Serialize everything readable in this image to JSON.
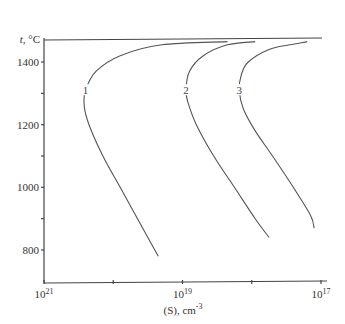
{
  "chart_data": {
    "type": "line",
    "title": "",
    "ylabel": "t, °C",
    "xlabel": "(S), cm",
    "xlabel_exponent": "-3",
    "x_scale": "log (reversed)",
    "xlim": [
      "1e21",
      "1e17"
    ],
    "ylim": [
      700,
      1480
    ],
    "y_ticks": [
      {
        "value": 1400,
        "label": "1400"
      },
      {
        "value": 1300,
        "label": ""
      },
      {
        "value": 1200,
        "label": "1200"
      },
      {
        "value": 1100,
        "label": ""
      },
      {
        "value": 1000,
        "label": "1000"
      },
      {
        "value": 900,
        "label": ""
      },
      {
        "value": 800,
        "label": "800"
      }
    ],
    "x_ticks": [
      {
        "value": "1e21",
        "base": "10",
        "exp": "21"
      },
      {
        "value": "1e20",
        "base": "",
        "exp": ""
      },
      {
        "value": "1e19",
        "base": "10",
        "exp": "19"
      },
      {
        "value": "1e18",
        "base": "",
        "exp": ""
      },
      {
        "value": "1e17",
        "base": "10",
        "exp": "17"
      }
    ],
    "grid": false,
    "solidus_line": {
      "y": 1465,
      "description": "horizontal line at top of plot"
    },
    "series": [
      {
        "name": "1",
        "label": "1",
        "points": [
          {
            "logS": 18.35,
            "t": 1465
          },
          {
            "logS": 19.3,
            "t": 1455
          },
          {
            "logS": 19.9,
            "t": 1420
          },
          {
            "logS": 20.25,
            "t": 1370
          },
          {
            "logS": 20.4,
            "t": 1310
          },
          {
            "logS": 20.42,
            "t": 1260
          },
          {
            "logS": 20.35,
            "t": 1200
          },
          {
            "logS": 20.15,
            "t": 1100
          },
          {
            "logS": 19.9,
            "t": 1000
          },
          {
            "logS": 19.65,
            "t": 900
          },
          {
            "logS": 19.45,
            "t": 820
          },
          {
            "logS": 19.35,
            "t": 780
          }
        ]
      },
      {
        "name": "2",
        "label": "2",
        "points": [
          {
            "logS": 17.95,
            "t": 1465
          },
          {
            "logS": 18.35,
            "t": 1455
          },
          {
            "logS": 18.7,
            "t": 1420
          },
          {
            "logS": 18.9,
            "t": 1370
          },
          {
            "logS": 18.95,
            "t": 1310
          },
          {
            "logS": 18.92,
            "t": 1270
          },
          {
            "logS": 18.8,
            "t": 1200
          },
          {
            "logS": 18.55,
            "t": 1100
          },
          {
            "logS": 18.25,
            "t": 1000
          },
          {
            "logS": 17.95,
            "t": 900
          },
          {
            "logS": 17.75,
            "t": 840
          }
        ]
      },
      {
        "name": "3",
        "label": "3",
        "points": [
          {
            "logS": 17.2,
            "t": 1465
          },
          {
            "logS": 17.45,
            "t": 1455
          },
          {
            "logS": 17.75,
            "t": 1440
          },
          {
            "logS": 18.05,
            "t": 1400
          },
          {
            "logS": 18.15,
            "t": 1360
          },
          {
            "logS": 18.18,
            "t": 1310
          },
          {
            "logS": 18.12,
            "t": 1250
          },
          {
            "logS": 17.95,
            "t": 1180
          },
          {
            "logS": 17.7,
            "t": 1100
          },
          {
            "logS": 17.4,
            "t": 1000
          },
          {
            "logS": 17.15,
            "t": 910
          },
          {
            "logS": 17.1,
            "t": 870
          }
        ]
      }
    ]
  }
}
